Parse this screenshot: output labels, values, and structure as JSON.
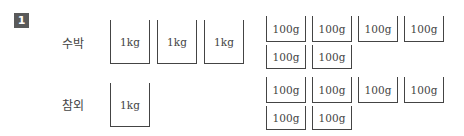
{
  "problem_number": "1",
  "rows": [
    {
      "label": "수박",
      "kg_boxes": [
        "1kg",
        "1kg",
        "1kg"
      ],
      "g_boxes_row1": [
        "100g",
        "100g",
        "100g",
        "100g"
      ],
      "g_boxes_row2": [
        "100g",
        "100g"
      ]
    },
    {
      "label": "참외",
      "kg_boxes": [
        "1kg"
      ],
      "g_boxes_row1": [
        "100g",
        "100g",
        "100g",
        "100g"
      ],
      "g_boxes_row2": [
        "100g",
        "100g"
      ]
    }
  ]
}
